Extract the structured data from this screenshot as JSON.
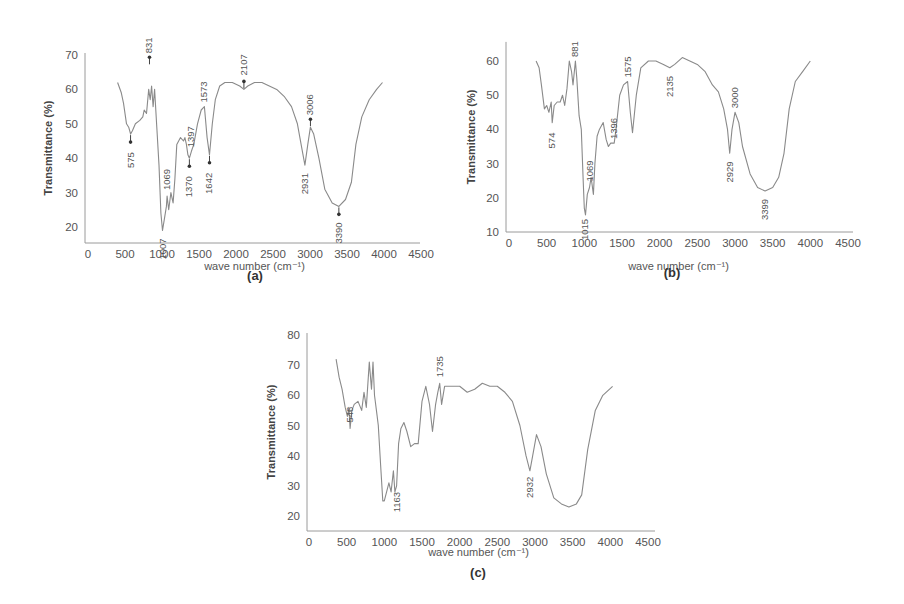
{
  "figure_labels": [
    "(a)",
    "(b)",
    "(c)"
  ],
  "chart_data": [
    {
      "type": "line",
      "panel": "(a)",
      "title": "",
      "xlabel": "wave number (cm⁻¹)",
      "ylabel": "Transmittance (%)",
      "xlim": [
        0,
        4500
      ],
      "ylim": [
        15,
        70
      ],
      "xticks": [
        0,
        500,
        1000,
        1500,
        2000,
        2500,
        3000,
        3500,
        4000,
        4500
      ],
      "yticks": [
        20,
        30,
        40,
        50,
        60,
        70
      ],
      "grid": false,
      "series": [
        {
          "name": "spectrum (a)",
          "x": [
            400,
            450,
            480,
            520,
            550,
            575,
            600,
            640,
            700,
            740,
            760,
            790,
            820,
            840,
            860,
            880,
            900,
            930,
            960,
            985,
            1007,
            1030,
            1060,
            1069,
            1090,
            1120,
            1150,
            1175,
            1200,
            1250,
            1290,
            1310,
            1330,
            1350,
            1370,
            1397,
            1430,
            1480,
            1530,
            1573,
            1610,
            1642,
            1680,
            1720,
            1780,
            1850,
            1950,
            2050,
            2107,
            2160,
            2250,
            2350,
            2450,
            2550,
            2650,
            2750,
            2830,
            2880,
            2931,
            2970,
            3006,
            3050,
            3120,
            3200,
            3300,
            3390,
            3480,
            3560,
            3620,
            3700,
            3800,
            3900,
            3980
          ],
          "values": [
            62,
            59,
            56,
            50,
            49,
            47,
            48,
            50,
            51,
            52,
            54,
            53,
            60,
            57,
            61,
            55,
            60,
            49,
            38,
            24,
            19,
            22,
            26,
            29,
            25,
            30,
            27,
            34,
            44,
            46,
            45,
            46,
            44,
            41,
            40,
            42,
            44,
            50,
            54,
            55,
            46,
            41,
            50,
            57,
            61,
            62,
            62,
            61,
            60,
            61,
            62,
            62,
            61,
            60,
            58,
            55,
            50,
            44,
            38,
            44,
            49,
            47,
            40,
            31,
            27,
            26,
            28,
            33,
            44,
            52,
            57,
            60,
            62
          ]
        }
      ],
      "annotations": [
        {
          "label": "575",
          "x": 575,
          "y": 47
        },
        {
          "label": "831",
          "x": 831,
          "y": 67
        },
        {
          "label": "1007",
          "x": 1007,
          "y": 19
        },
        {
          "label": "1069",
          "x": 1069,
          "y": 29
        },
        {
          "label": "1370",
          "x": 1370,
          "y": 40
        },
        {
          "label": "1397",
          "x": 1397,
          "y": 42
        },
        {
          "label": "1573",
          "x": 1573,
          "y": 55
        },
        {
          "label": "1642",
          "x": 1642,
          "y": 41
        },
        {
          "label": "2107",
          "x": 2107,
          "y": 60
        },
        {
          "label": "2931",
          "x": 2931,
          "y": 38
        },
        {
          "label": "3006",
          "x": 3006,
          "y": 49
        },
        {
          "label": "3390",
          "x": 3390,
          "y": 26
        }
      ]
    },
    {
      "type": "line",
      "panel": "(b)",
      "title": "",
      "xlabel": "wave number (cm⁻¹)",
      "ylabel": "Transmittance (%)",
      "xlim": [
        0,
        4500
      ],
      "ylim": [
        10,
        65
      ],
      "xticks": [
        0,
        500,
        1000,
        1500,
        2000,
        2500,
        3000,
        3500,
        4000,
        4500
      ],
      "yticks": [
        10,
        20,
        30,
        40,
        50,
        60
      ],
      "grid": false,
      "series": [
        {
          "name": "spectrum (b)",
          "x": [
            360,
            400,
            430,
            470,
            500,
            530,
            560,
            574,
            600,
            640,
            680,
            710,
            740,
            770,
            800,
            830,
            850,
            881,
            900,
            930,
            960,
            985,
            1000,
            1015,
            1040,
            1069,
            1090,
            1120,
            1140,
            1170,
            1200,
            1250,
            1290,
            1320,
            1350,
            1396,
            1420,
            1470,
            1520,
            1575,
            1610,
            1640,
            1690,
            1750,
            1850,
            1950,
            2050,
            2135,
            2200,
            2300,
            2400,
            2500,
            2600,
            2700,
            2780,
            2850,
            2900,
            2929,
            2960,
            3000,
            3050,
            3100,
            3200,
            3300,
            3399,
            3500,
            3580,
            3650,
            3720,
            3800,
            3900,
            4000
          ],
          "values": [
            60,
            58,
            53,
            46,
            47,
            45,
            48,
            42,
            47,
            48,
            48,
            50,
            47,
            52,
            60,
            57,
            53,
            60,
            55,
            44,
            40,
            25,
            17,
            15,
            21,
            23,
            26,
            21,
            30,
            38,
            40,
            42,
            37,
            35,
            36,
            36,
            40,
            50,
            53,
            54,
            45,
            39,
            50,
            58,
            60,
            60,
            59,
            58,
            59,
            61,
            60,
            59,
            57,
            53,
            51,
            46,
            40,
            33,
            40,
            45,
            42,
            35,
            27,
            23,
            22,
            23,
            26,
            33,
            46,
            54,
            57,
            60
          ]
        }
      ],
      "annotations": [
        {
          "label": "574",
          "x": 574,
          "y": 42
        },
        {
          "label": "881",
          "x": 881,
          "y": 60
        },
        {
          "label": "1015",
          "x": 1015,
          "y": 15
        },
        {
          "label": "1069",
          "x": 1069,
          "y": 23
        },
        {
          "label": "1396",
          "x": 1396,
          "y": 36
        },
        {
          "label": "1575",
          "x": 1575,
          "y": 54
        },
        {
          "label": "2135",
          "x": 2135,
          "y": 58
        },
        {
          "label": "2929",
          "x": 2929,
          "y": 33
        },
        {
          "label": "3000",
          "x": 3000,
          "y": 45
        },
        {
          "label": "3399",
          "x": 3399,
          "y": 22
        }
      ]
    },
    {
      "type": "line",
      "panel": "(c)",
      "title": "",
      "xlabel": "wave number (cm⁻¹)",
      "ylabel": "Transmittance (%)",
      "xlim": [
        0,
        4500
      ],
      "ylim": [
        15,
        80
      ],
      "xticks": [
        0,
        500,
        1000,
        1500,
        2000,
        2500,
        3000,
        3500,
        4000,
        4500
      ],
      "yticks": [
        20,
        30,
        40,
        50,
        60,
        70,
        80
      ],
      "grid": false,
      "series": [
        {
          "name": "spectrum (c)",
          "x": [
            360,
            400,
            440,
            480,
            510,
            530,
            546,
            570,
            600,
            650,
            700,
            730,
            760,
            800,
            830,
            850,
            870,
            900,
            920,
            950,
            980,
            1000,
            1030,
            1060,
            1090,
            1120,
            1140,
            1163,
            1190,
            1220,
            1260,
            1300,
            1350,
            1400,
            1450,
            1500,
            1550,
            1600,
            1640,
            1680,
            1710,
            1735,
            1760,
            1800,
            1900,
            2000,
            2100,
            2200,
            2300,
            2400,
            2500,
            2600,
            2700,
            2800,
            2880,
            2932,
            2970,
            3020,
            3080,
            3150,
            3250,
            3350,
            3450,
            3550,
            3620,
            3700,
            3800,
            3900,
            4030
          ],
          "values": [
            72,
            66,
            62,
            56,
            53,
            56,
            49,
            55,
            57,
            58,
            55,
            61,
            56,
            71,
            62,
            71,
            60,
            54,
            50,
            37,
            25,
            25,
            28,
            31,
            28,
            35,
            28,
            30,
            44,
            49,
            51,
            48,
            43,
            44,
            44,
            58,
            63,
            57,
            48,
            57,
            61,
            64,
            57,
            63,
            63,
            63,
            61,
            62,
            64,
            63,
            63,
            61,
            58,
            50,
            40,
            35,
            40,
            47,
            43,
            34,
            26,
            24,
            23,
            24,
            27,
            42,
            55,
            60,
            63
          ]
        }
      ],
      "annotations": [
        {
          "label": "546",
          "x": 546,
          "y": 49
        },
        {
          "label": "1163",
          "x": 1163,
          "y": 30
        },
        {
          "label": "1735",
          "x": 1735,
          "y": 64
        },
        {
          "label": "2932",
          "x": 2932,
          "y": 35
        }
      ]
    }
  ]
}
